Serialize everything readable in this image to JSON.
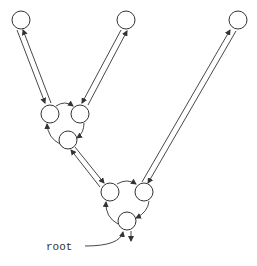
{
  "diagram": {
    "type": "tree-of-cycles",
    "colors": {
      "stroke": "#333333",
      "background": "#ffffff"
    },
    "label": {
      "text": "root"
    },
    "nodes": [
      {
        "id": "a",
        "x": 21,
        "y": 20
      },
      {
        "id": "b",
        "x": 126,
        "y": 20
      },
      {
        "id": "c",
        "x": 238,
        "y": 20
      },
      {
        "id": "d",
        "x": 50,
        "y": 114
      },
      {
        "id": "e",
        "x": 80,
        "y": 114
      },
      {
        "id": "f",
        "x": 68,
        "y": 140
      },
      {
        "id": "g",
        "x": 110,
        "y": 192
      },
      {
        "id": "h",
        "x": 144,
        "y": 192
      },
      {
        "id": "i",
        "x": 127,
        "y": 221
      }
    ],
    "cycles": [
      {
        "nodes": [
          "d",
          "e",
          "f"
        ]
      },
      {
        "nodes": [
          "g",
          "h",
          "i"
        ]
      }
    ],
    "bidirectional_edges": [
      {
        "from": "a",
        "to": "d"
      },
      {
        "from": "b",
        "to": "e"
      },
      {
        "from": "c",
        "to": "h"
      },
      {
        "from": "f",
        "to": "g"
      }
    ]
  }
}
